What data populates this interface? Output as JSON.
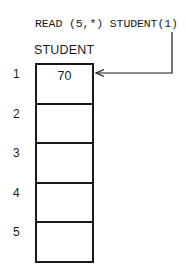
{
  "statement": "READ (5,*) STUDENT(1)",
  "array": {
    "name": "STUDENT",
    "cells": [
      {
        "index": "1",
        "value": "70"
      },
      {
        "index": "2",
        "value": ""
      },
      {
        "index": "3",
        "value": ""
      },
      {
        "index": "4",
        "value": ""
      },
      {
        "index": "5",
        "value": ""
      }
    ]
  },
  "arrow": {
    "from": "STUDENT(1) in READ statement",
    "to": "STUDENT cell 1"
  },
  "colors": {
    "ink": "#1a1a1a",
    "background": "#ffffff"
  }
}
